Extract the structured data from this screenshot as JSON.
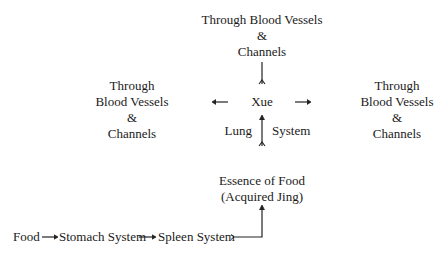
{
  "diagram": {
    "top": {
      "lines": [
        "Through Blood Vessels",
        "&",
        "Channels"
      ]
    },
    "left": {
      "lines": [
        "Through",
        "Blood Vessels",
        "&",
        "Channels"
      ]
    },
    "right": {
      "lines": [
        "Through",
        "Blood Vessels",
        "&",
        "Channels"
      ]
    },
    "center": {
      "label": "Xue"
    },
    "lung_label": "Lung",
    "system_label": "System",
    "essence": {
      "lines": [
        "Essence of Food",
        "(Acquired Jing)"
      ]
    },
    "bottom_flow": {
      "food": "Food",
      "stomach": "Stomach System",
      "spleen": "Spleen System"
    }
  }
}
